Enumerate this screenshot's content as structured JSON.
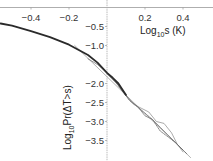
{
  "chart_data": {
    "type": "line",
    "title": "",
    "xlabel": "Log10s (K)",
    "ylabel": "Log10Pr(ΔT>s)",
    "xlabel_parts": {
      "pre": "Log",
      "sub": "10",
      "post": "s (K)"
    },
    "ylabel_parts": {
      "pre": "Log",
      "sub": "10",
      "post": "Pr(ΔT>s)"
    },
    "xlim": [
      -0.56,
      0.56
    ],
    "ylim": [
      -4.0,
      0.0
    ],
    "x_ticks": [
      -0.4,
      -0.2,
      0.2,
      0.4
    ],
    "x_tick_labels": [
      "−0.4",
      "−0.2",
      "0.2",
      "0.4"
    ],
    "y_ticks": [
      -0.5,
      -1.0,
      -2.0,
      -2.5,
      -3.0,
      -3.5
    ],
    "y_tick_labels": [
      "−0.5",
      "−1.0",
      "−2.0",
      "−2.5",
      "−3.0",
      "−3.5"
    ],
    "grid": false,
    "axes_origin": [
      0,
      0
    ],
    "series": [
      {
        "name": "fitted curve",
        "style": "thick-black",
        "color": "#2a2a2a",
        "x": [
          -0.56,
          -0.5,
          -0.4,
          -0.3,
          -0.2,
          -0.1,
          -0.05,
          0.0,
          0.03,
          0.06,
          0.1
        ],
        "y": [
          -0.42,
          -0.48,
          -0.62,
          -0.78,
          -0.98,
          -1.25,
          -1.45,
          -1.72,
          -1.85,
          -2.0,
          -2.3
        ]
      },
      {
        "name": "empirical 1",
        "style": "thin-gray",
        "color": "#666666",
        "x": [
          -0.1,
          -0.05,
          0.0,
          0.04,
          0.08,
          0.12,
          0.16,
          0.2,
          0.24,
          0.28,
          0.32,
          0.36,
          0.4
        ],
        "y": [
          -1.35,
          -1.5,
          -1.72,
          -1.9,
          -2.2,
          -2.45,
          -2.6,
          -2.85,
          -2.95,
          -3.15,
          -3.35,
          -3.55,
          -3.75
        ]
      },
      {
        "name": "empirical 2",
        "style": "thin-gray",
        "color": "#888888",
        "x": [
          0.0,
          0.05,
          0.1,
          0.14,
          0.18,
          0.22,
          0.26,
          0.3,
          0.34,
          0.37,
          0.4
        ],
        "y": [
          -1.75,
          -2.0,
          -2.3,
          -2.55,
          -2.65,
          -2.75,
          -3.0,
          -3.05,
          -3.3,
          -3.6,
          -3.8
        ]
      },
      {
        "name": "empirical 3",
        "style": "thin-dotted",
        "color": "#555555",
        "x": [
          0.0,
          0.06,
          0.12,
          0.18,
          0.24,
          0.28,
          0.32,
          0.36,
          0.42
        ],
        "y": [
          -1.72,
          -2.05,
          -2.45,
          -2.7,
          -2.95,
          -3.25,
          -3.4,
          -3.55,
          -3.85
        ]
      },
      {
        "name": "power-law tail",
        "style": "thin-light-gray",
        "color": "#aaaaaa",
        "x": [
          -0.17,
          0.44
        ],
        "y": [
          -1.0,
          -3.95
        ]
      }
    ]
  }
}
